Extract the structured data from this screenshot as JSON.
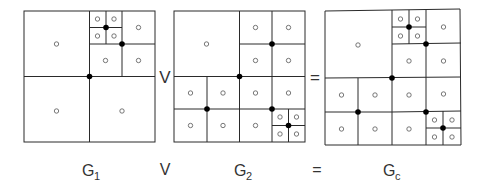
{
  "diagram": {
    "operators": {
      "join": "V",
      "equals": "="
    },
    "labels": {
      "g1": {
        "base": "G",
        "sub": "1"
      },
      "join": "V",
      "g2": {
        "base": "G",
        "sub": "2"
      },
      "equals": "=",
      "gc": {
        "base": "G",
        "sub": "c"
      }
    },
    "colors": {
      "line": "#2a2a2a",
      "solid_node": "#000000",
      "open_node": "#555555",
      "background": "#ffffff"
    },
    "grids": [
      {
        "name": "G1",
        "description": "Quadtree: root split; top-right quadrant split; its top-left sub-cell split again",
        "cell_count": 10,
        "split_node_count": 3
      },
      {
        "name": "G2",
        "description": "Quadtree: root split; top-right, bottom-left, bottom-right quadrants split; bottom-right's bottom-right sub-cell split again",
        "cell_count": 16,
        "split_node_count": 5
      },
      {
        "name": "Gc",
        "description": "Union (join) of G1 and G2 refinements",
        "cell_count": 22,
        "split_node_count": 6
      }
    ]
  }
}
